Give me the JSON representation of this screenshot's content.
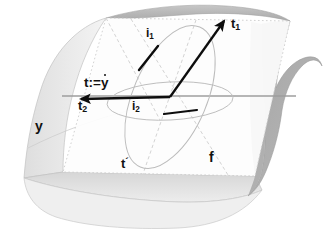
{
  "figure": {
    "background_color": "#ffffff",
    "labels": {
      "t1": {
        "text": "t",
        "sub": "1",
        "x": 232,
        "y": 24
      },
      "t2": {
        "text": "t",
        "sub": "2",
        "x": 80,
        "y": 104
      },
      "i1": {
        "text": "i",
        "sub": "1",
        "x": 147,
        "y": 33
      },
      "i2": {
        "text": "i",
        "sub": "2",
        "x": 133,
        "y": 106
      },
      "t_def": {
        "text": "t:=",
        "dotted_var": "y",
        "x": 85,
        "y": 78
      },
      "t_prime": {
        "text": "t",
        "prime": "´",
        "x": 122,
        "y": 163
      },
      "y": {
        "text": "y",
        "x": 37,
        "y": 125
      },
      "f": {
        "text": "f",
        "x": 210,
        "y": 157
      }
    },
    "colors": {
      "surface_light": "#e8e8e8",
      "surface_mid": "#d9d9d9",
      "surface_dark": "#a8a8a8",
      "surface_edge": "#b5b5b5",
      "plane_fill": "#fdfdfd",
      "plane_edge": "#cfcfcf",
      "ellipse_stroke": "#b9b9b9",
      "dashed_stroke": "#c9c9c9",
      "axis_gray": "#9a9a9a",
      "vector_black": "#0d0d0d",
      "label_black": "#111111"
    },
    "geometry": {
      "center_point": {
        "x": 170,
        "y": 97
      },
      "t1_arrow": {
        "from_x": 170,
        "from_y": 97,
        "to_x": 224,
        "to_y": 21
      },
      "t2_arrow": {
        "from_x": 170,
        "from_y": 97,
        "to_x": 80,
        "to_y": 99
      },
      "i1_segment": {
        "from_x": 140,
        "from_y": 68,
        "to_x": 157,
        "to_y": 47
      },
      "i2_segment": {
        "from_x": 165,
        "from_y": 114,
        "to_x": 196,
        "to_y": 110
      },
      "tilted_ellipse": {
        "cx": 170,
        "cy": 97,
        "rx": 37,
        "ry": 76,
        "rotate": 23
      },
      "flat_ellipse": {
        "cx": 170,
        "cy": 101,
        "rx": 63,
        "ry": 19,
        "rotate": -3
      },
      "horizontal_axis": {
        "x1": 62,
        "y1": 96,
        "x2": 296,
        "y2": 96
      },
      "tangent_plane_corners": [
        {
          "x": 106,
          "y": 18
        },
        {
          "x": 290,
          "y": 21
        },
        {
          "x": 255,
          "y": 176
        },
        {
          "x": 63,
          "y": 172
        }
      ]
    },
    "elements": {
      "surface_name": "curved-saddle-surface",
      "plane_name": "tangent-plane",
      "tilted_ellipse_name": "indicatrix-ellipse-tilted",
      "flat_ellipse_name": "indicatrix-ellipse-flat"
    }
  }
}
